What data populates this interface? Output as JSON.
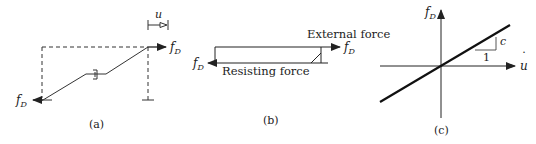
{
  "panels": {
    "a": {
      "caption": "(a)",
      "force_left": "f",
      "force_left_sub": "D",
      "force_right": "f",
      "force_right_sub": "D",
      "displacement": "u"
    },
    "b": {
      "caption": "(b)",
      "external_label": "External force",
      "resisting_label": "Resisting force",
      "force_right": "f",
      "force_right_sub": "D",
      "force_left": "f",
      "force_left_sub": "D"
    },
    "c": {
      "caption": "(c)",
      "y_axis": "f",
      "y_axis_sub": "D",
      "x_axis": "u",
      "x_axis_dot": "˙",
      "slope_label": "c",
      "run_label": "1"
    }
  },
  "colors": {
    "ink": "#222222",
    "background": "#ffffff"
  }
}
